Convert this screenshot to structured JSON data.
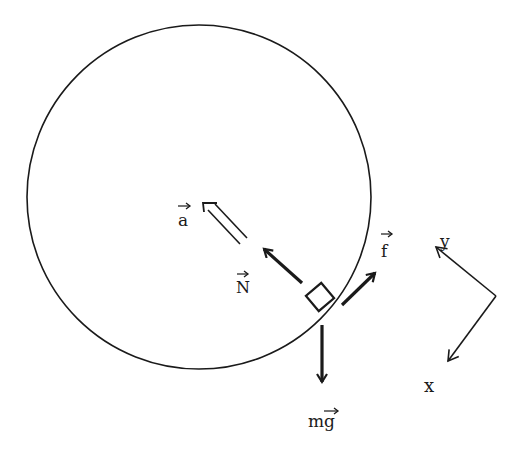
{
  "diagram": {
    "type": "free-body diagram",
    "colors": {
      "ink": "#1a1a1a",
      "background": "#ffffff"
    },
    "circle": {
      "cx": 199,
      "cy": 197,
      "r": 172
    },
    "block": {
      "cx": 320,
      "cy": 297,
      "size": 20,
      "rotation_deg": -40
    },
    "vectors": {
      "acceleration": {
        "label": "a",
        "style": "double-line hollow",
        "from": [
          255,
          245
        ],
        "to": [
          207,
          203
        ]
      },
      "normal": {
        "label": "N",
        "style": "bold",
        "from": [
          302,
          283
        ],
        "to": [
          262,
          247
        ]
      },
      "friction": {
        "label": "f",
        "style": "bold",
        "from": [
          342,
          305
        ],
        "to": [
          377,
          271
        ]
      },
      "gravity": {
        "label": "mg",
        "style": "bold",
        "from": [
          322,
          326
        ],
        "to": [
          322,
          384
        ]
      }
    },
    "axes": {
      "origin": [
        496,
        296
      ],
      "y_axis": {
        "label": "y",
        "to": [
          434,
          246
        ]
      },
      "x_axis": {
        "label": "x",
        "to": [
          446,
          363
        ]
      }
    }
  }
}
